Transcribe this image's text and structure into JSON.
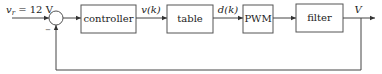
{
  "diagram": {
    "type": "block-diagram-feedback-loop",
    "input": {
      "label_var": "v",
      "label_sub": "r",
      "label_value": " = 12 V"
    },
    "summing_junction": {
      "feedback_sign": "−"
    },
    "blocks": [
      {
        "id": "controller",
        "label": "controller"
      },
      {
        "id": "table",
        "label": "table"
      },
      {
        "id": "pwm",
        "label": "PWM"
      },
      {
        "id": "filter",
        "label": "filter"
      }
    ],
    "signals": {
      "controller_to_table": "v(k)",
      "table_to_pwm": "d(k)",
      "output": "V"
    },
    "colors": {
      "stroke": "#444444",
      "box_stroke": "#555555",
      "text": "#222222",
      "background": "#ffffff"
    }
  }
}
